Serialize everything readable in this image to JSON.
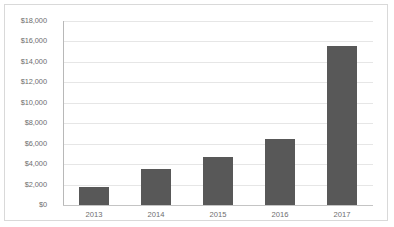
{
  "chart_data": {
    "type": "bar",
    "title": "",
    "subtitle": "",
    "xlabel": "",
    "ylabel": "",
    "categories": [
      "2013",
      "2014",
      "2015",
      "2016",
      "2017"
    ],
    "values": [
      1800,
      3500,
      4700,
      6500,
      15600
    ],
    "ylim": [
      0,
      18000
    ],
    "ytick_step": 2000,
    "ytick_labels": [
      "$18,000",
      "$16,000",
      "$14,000",
      "$12,000",
      "$10,000",
      "$8,000",
      "$6,000",
      "$4,000",
      "$2,000",
      "$0"
    ],
    "ytick_values": [
      18000,
      16000,
      14000,
      12000,
      10000,
      8000,
      6000,
      4000,
      2000,
      0
    ],
    "grid": true,
    "legend": false,
    "legend_position": "none",
    "series": [
      {
        "name": "",
        "values": [
          1800,
          3500,
          4700,
          6500,
          15600
        ]
      }
    ],
    "colors": {
      "bar_fill": "#585858",
      "gridline": "#e6e6e6",
      "axis_line": "#b8b8b8",
      "border": "#d9d9d9",
      "tick_text": "#6e6e6e",
      "background": "#ffffff"
    }
  }
}
